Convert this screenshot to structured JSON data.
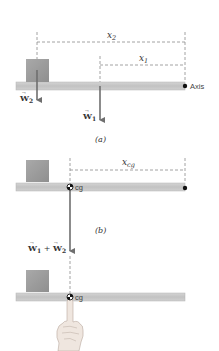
{
  "panels": {
    "a": {
      "caption": "(a)",
      "x2_label": "x",
      "x2_sub": "2",
      "x1_label": "x",
      "x1_sub": "1",
      "w2_label": "W",
      "w2_sub": "2",
      "w1_label": "W",
      "w1_sub": "1",
      "axis_label": "Axis"
    },
    "b": {
      "caption": "(b)",
      "xcg_label": "x",
      "xcg_sub": "cg",
      "cg_label": "cg",
      "sum_label_w1": "W",
      "sum_sub_1": "1",
      "sum_plus": " + ",
      "sum_label_w2": "W",
      "sum_sub_2": "2"
    },
    "c": {
      "cg_label": "cg"
    }
  },
  "colors": {
    "beam": "#c9c9c9",
    "beam_edge": "#b3b3b3",
    "box": "#9e9e9e",
    "arrow": "#6f6f6f",
    "dashed": "#8a8a8a",
    "text": "#333333",
    "hand": "#efe6df",
    "hand_edge": "#b8aaa0"
  }
}
